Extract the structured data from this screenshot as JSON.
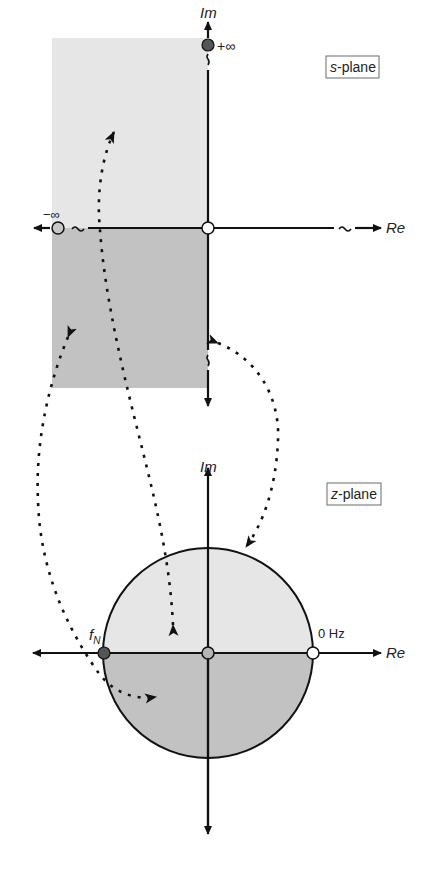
{
  "s_plane": {
    "title_var": "s",
    "title_rest": "-plane",
    "im_label": "Im",
    "re_label": "Re",
    "plus_infinity_label": "+∞",
    "minus_infinity_label": "−∞",
    "break_symbol": "~",
    "regions": {
      "upper_half": {
        "description": "positive frequencies, left half plane",
        "color": "#e6e6e6"
      },
      "lower_half": {
        "description": "negative frequencies, left half plane",
        "color": "#c2c2c2"
      }
    },
    "points": [
      {
        "name": "plus-infinity",
        "style": "filled",
        "color": "#555555"
      },
      {
        "name": "minus-infinity",
        "style": "open",
        "color": "#c8c8c8"
      },
      {
        "name": "origin",
        "style": "open",
        "color": "#ffffff"
      }
    ]
  },
  "z_plane": {
    "title_var": "z",
    "title_rest": "-plane",
    "im_label": "Im",
    "re_label": "Re",
    "nyquist_label_main": "f",
    "nyquist_label_sub": "N",
    "zero_hz_label": "0 Hz",
    "regions": {
      "upper_half": {
        "description": "upper half of unit circle",
        "color": "#e6e6e6"
      },
      "lower_half": {
        "description": "lower half of unit circle",
        "color": "#c2c2c2"
      }
    },
    "points": [
      {
        "name": "nyquist",
        "style": "filled",
        "color": "#555555"
      },
      {
        "name": "center",
        "style": "filled",
        "color": "#b5b5b5"
      },
      {
        "name": "zero-hz",
        "style": "open",
        "color": "#ffffff"
      }
    ]
  },
  "mappings": [
    {
      "from": "s-plane +Im axis",
      "to": "z-plane upper unit circle"
    },
    {
      "from": "s-plane upper left half",
      "to": "z-plane upper circle interior"
    },
    {
      "from": "s-plane lower left half",
      "to": "z-plane lower circle interior"
    },
    {
      "from": "s-plane -Im axis",
      "to": "z-plane unit circle"
    }
  ],
  "colors": {
    "axis": "#111111",
    "light_fill": "#e6e6e6",
    "dark_fill": "#c2c2c2",
    "filled_point": "#555555"
  }
}
